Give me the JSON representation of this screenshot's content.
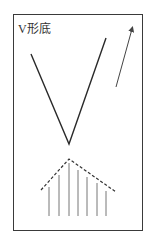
{
  "diagram": {
    "title": "V形底",
    "pattern": "v-bottom",
    "colors": {
      "line": "#2a2a2a",
      "arrow": "#444444",
      "dashed": "#333333",
      "bars": "#777777",
      "frame": "#3a3a3a"
    },
    "v_line": {
      "points": [
        [
          31,
          54
        ],
        [
          69,
          144
        ],
        [
          106,
          38
        ]
      ]
    },
    "arrow": {
      "from": [
        116,
        87
      ],
      "to": [
        132,
        29
      ],
      "direction": "up"
    },
    "volume_envelope": {
      "points": [
        [
          41,
          190
        ],
        [
          69,
          159
        ],
        [
          116,
          192
        ]
      ],
      "style": "dashed"
    },
    "volume_bars": [
      {
        "x": 49,
        "top": 187,
        "bottom": 216
      },
      {
        "x": 59,
        "top": 175,
        "bottom": 216
      },
      {
        "x": 69,
        "top": 163,
        "bottom": 216
      },
      {
        "x": 78,
        "top": 170,
        "bottom": 216
      },
      {
        "x": 87,
        "top": 177,
        "bottom": 216
      },
      {
        "x": 97,
        "top": 183,
        "bottom": 216
      },
      {
        "x": 106,
        "top": 191,
        "bottom": 216
      }
    ]
  }
}
